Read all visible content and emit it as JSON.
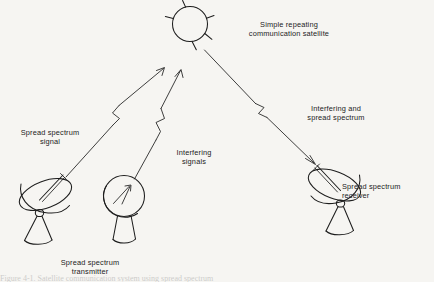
{
  "figure": {
    "type": "line-diagram",
    "background_color": "#f6f5f2",
    "ink_color": "#1a1a1a",
    "width": 434,
    "height": 282
  },
  "labels": {
    "satellite_line1": "Simple repeating",
    "satellite_line2": "communication satellite",
    "uplink_signal_line1": "Spread spectrum",
    "uplink_signal_line2": "signal",
    "interfering_line1": "Interfering",
    "interfering_line2": "signals",
    "downlink_line1": "Interfering and",
    "downlink_line2": "spread spectrum",
    "receiver_line1": "Spread spectrum",
    "receiver_line2": "receiver",
    "transmitter_line1": "Spread spectrum",
    "transmitter_line2": "transmitter"
  },
  "caption": {
    "cropped_text": "Figure 4-1.  Satellite communication system using spread spectrum"
  },
  "elements": {
    "satellite_name": "communication-satellite",
    "transmitter_dish_name": "spread-spectrum-transmitter-dish",
    "jammer_dish_name": "interfering-jammer-dish",
    "receiver_dish_name": "spread-spectrum-receiver-dish",
    "uplink_arrow_name": "uplink-spread-spectrum-arrow",
    "jam_arrow_name": "uplink-interfering-arrow",
    "downlink_arrow_name": "downlink-combined-arrow"
  }
}
